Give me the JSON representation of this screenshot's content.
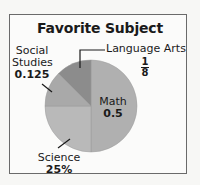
{
  "chart_data": {
    "type": "pie",
    "title": "Favorite Subject",
    "categories": [
      "Math",
      "Science",
      "Social Studies",
      "Language Arts"
    ],
    "values": [
      0.5,
      0.25,
      0.125,
      0.125
    ],
    "value_labels": [
      "0.5",
      "25%",
      "0.125",
      "1/8"
    ],
    "colors": [
      "#b0b0b0",
      "#b9b9b9",
      "#a9a9a9",
      "#8c8c8c"
    ],
    "legend": "none",
    "start_angle_deg": 0,
    "direction": "clockwise"
  },
  "title": "Favorite Subject",
  "labels": {
    "math": {
      "name": "Math",
      "value": "0.5"
    },
    "science": {
      "name": "Science",
      "value": "25%"
    },
    "social_studies": {
      "name_line1": "Social",
      "name_line2": "Studies",
      "value": "0.125"
    },
    "language_arts": {
      "name": "Language Arts",
      "numerator": "1",
      "denominator": "8"
    }
  }
}
